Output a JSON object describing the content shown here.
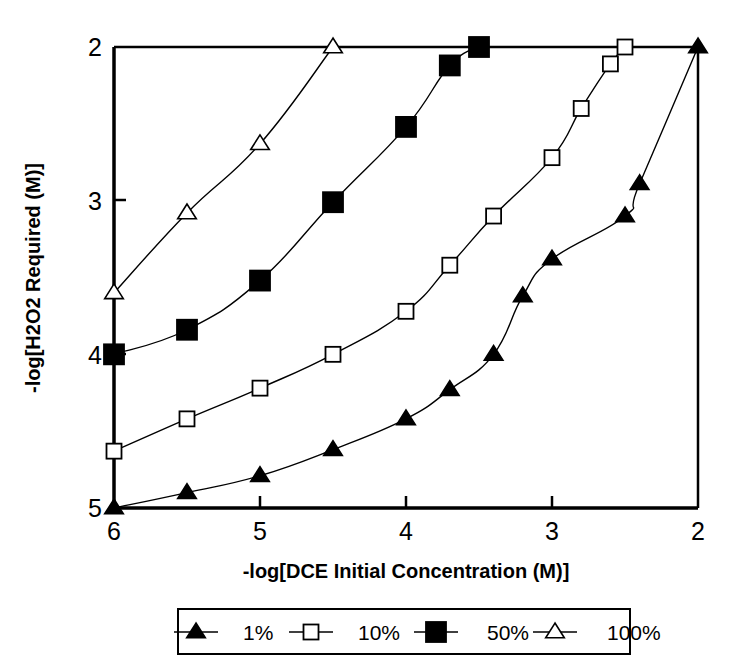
{
  "chart_data": {
    "type": "line",
    "title": "",
    "xlabel": "-log[DCE Initial Concentration (M)]",
    "ylabel": "-log[H2O2 Required (M)]",
    "xlim": [
      6,
      2
    ],
    "ylim": [
      5,
      2
    ],
    "x_ticks": [
      "6",
      "5",
      "4",
      "3",
      "2"
    ],
    "x_tick_values": [
      6,
      5,
      4,
      3,
      2
    ],
    "y_ticks": [
      "2",
      "3",
      "4",
      "5"
    ],
    "y_tick_values": [
      2,
      3,
      4,
      5
    ],
    "x_axis_reversed": true,
    "y_axis_reversed": true,
    "grid": false,
    "legend_position": "below",
    "series": [
      {
        "name": "1%",
        "marker": "filled-triangle",
        "color": "#000000",
        "points": [
          {
            "x": 6.0,
            "y": 5.0
          },
          {
            "x": 5.5,
            "y": 4.9
          },
          {
            "x": 5.0,
            "y": 4.79
          },
          {
            "x": 4.5,
            "y": 4.62
          },
          {
            "x": 4.0,
            "y": 4.42
          },
          {
            "x": 3.7,
            "y": 4.23
          },
          {
            "x": 3.4,
            "y": 4.0
          },
          {
            "x": 3.2,
            "y": 3.62
          },
          {
            "x": 3.0,
            "y": 3.38
          },
          {
            "x": 2.5,
            "y": 3.1
          },
          {
            "x": 2.4,
            "y": 2.89
          },
          {
            "x": 2.0,
            "y": 2.0
          }
        ]
      },
      {
        "name": "10%",
        "marker": "open-square",
        "color": "#000000",
        "points": [
          {
            "x": 6.0,
            "y": 4.63
          },
          {
            "x": 5.5,
            "y": 4.42
          },
          {
            "x": 5.0,
            "y": 4.22
          },
          {
            "x": 4.5,
            "y": 4.0
          },
          {
            "x": 4.0,
            "y": 3.72
          },
          {
            "x": 3.7,
            "y": 3.42
          },
          {
            "x": 3.4,
            "y": 3.1
          },
          {
            "x": 3.0,
            "y": 2.72
          },
          {
            "x": 2.8,
            "y": 2.4
          },
          {
            "x": 2.6,
            "y": 2.11
          },
          {
            "x": 2.5,
            "y": 2.0
          }
        ]
      },
      {
        "name": "50%",
        "marker": "filled-square",
        "color": "#000000",
        "points": [
          {
            "x": 6.0,
            "y": 4.0
          },
          {
            "x": 5.5,
            "y": 3.84
          },
          {
            "x": 5.0,
            "y": 3.52
          },
          {
            "x": 4.5,
            "y": 3.01
          },
          {
            "x": 4.0,
            "y": 2.52
          },
          {
            "x": 3.7,
            "y": 2.12
          },
          {
            "x": 3.5,
            "y": 2.0
          }
        ]
      },
      {
        "name": "100%",
        "marker": "open-triangle",
        "color": "#000000",
        "points": [
          {
            "x": 6.0,
            "y": 3.6
          },
          {
            "x": 5.5,
            "y": 3.08
          },
          {
            "x": 5.0,
            "y": 2.63
          },
          {
            "x": 4.5,
            "y": 2.0
          }
        ]
      }
    ]
  },
  "legend": {
    "items": [
      {
        "label": "1%",
        "marker": "filled-triangle"
      },
      {
        "label": "10%",
        "marker": "open-square"
      },
      {
        "label": "50%",
        "marker": "filled-square"
      },
      {
        "label": "100%",
        "marker": "open-triangle"
      }
    ]
  }
}
